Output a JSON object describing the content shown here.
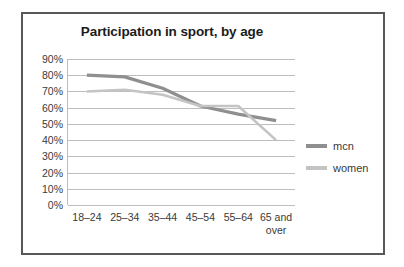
{
  "chart_data": {
    "type": "line",
    "title": "Participation in sport, by age",
    "xlabel": "",
    "ylabel": "",
    "categories": [
      "18–24",
      "25–34",
      "35–44",
      "45–54",
      "55–64",
      "65 and over"
    ],
    "series": [
      {
        "name": "mcn",
        "values": [
          80,
          79,
          72,
          61,
          56,
          52
        ],
        "color": "#8f8f8f",
        "width": 3.2
      },
      {
        "name": "women",
        "values": [
          70,
          71,
          68,
          61,
          61,
          40
        ],
        "color": "#c4c4c4",
        "width": 2.6
      }
    ],
    "ylim": [
      0,
      90
    ],
    "ytick_values": [
      90,
      80,
      70,
      60,
      50,
      40,
      30,
      20,
      10,
      0
    ],
    "ytick_labels": [
      "90%",
      "80%",
      "70%",
      "60%",
      "50%",
      "40%",
      "30%",
      "20%",
      "10%",
      "0%"
    ],
    "grid": true,
    "grid_axis": "y",
    "grid_color": "#bdbdbd",
    "legend_position": "right",
    "value_suffix": "%"
  },
  "frame": {
    "border_color": "#585858"
  }
}
